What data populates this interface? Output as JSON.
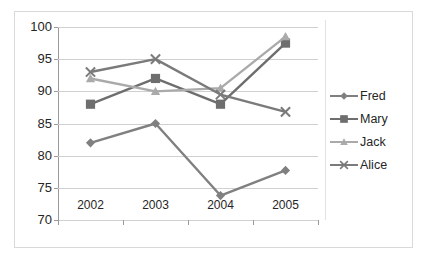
{
  "chart_data": {
    "type": "line",
    "title": "",
    "xlabel": "",
    "ylabel": "",
    "categories": [
      "2002",
      "2003",
      "2004",
      "2005"
    ],
    "ylim": [
      70,
      100
    ],
    "yticks": [
      70,
      75,
      80,
      85,
      90,
      95,
      100
    ],
    "grid": true,
    "legend_position": "right",
    "series": [
      {
        "name": "Fred",
        "marker": "diamond",
        "color": "#808080",
        "values": [
          82,
          85,
          73.8,
          77.7
        ]
      },
      {
        "name": "Mary",
        "marker": "square",
        "color": "#6e6e6e",
        "values": [
          88,
          92,
          88,
          97.5
        ]
      },
      {
        "name": "Jack",
        "marker": "triangle",
        "color": "#aaaaaa",
        "values": [
          92,
          90,
          90.5,
          98.5
        ]
      },
      {
        "name": "Alice",
        "marker": "x",
        "color": "#7a7a7a",
        "values": [
          93,
          95,
          89.5,
          86.8
        ]
      }
    ]
  },
  "axis": {
    "y_tick_labels": [
      "100",
      "95",
      "90",
      "85",
      "80",
      "75",
      "70"
    ],
    "x_tick_labels": [
      "2002",
      "2003",
      "2004",
      "2005"
    ]
  },
  "legend": {
    "items": [
      {
        "label": "Fred"
      },
      {
        "label": "Mary"
      },
      {
        "label": "Jack"
      },
      {
        "label": "Alice"
      }
    ]
  },
  "colors": {
    "gridline": "#d0d0d0",
    "axis": "#9a9a9a",
    "border": "#d9d9d9",
    "text": "#262626",
    "background": "#ffffff"
  }
}
